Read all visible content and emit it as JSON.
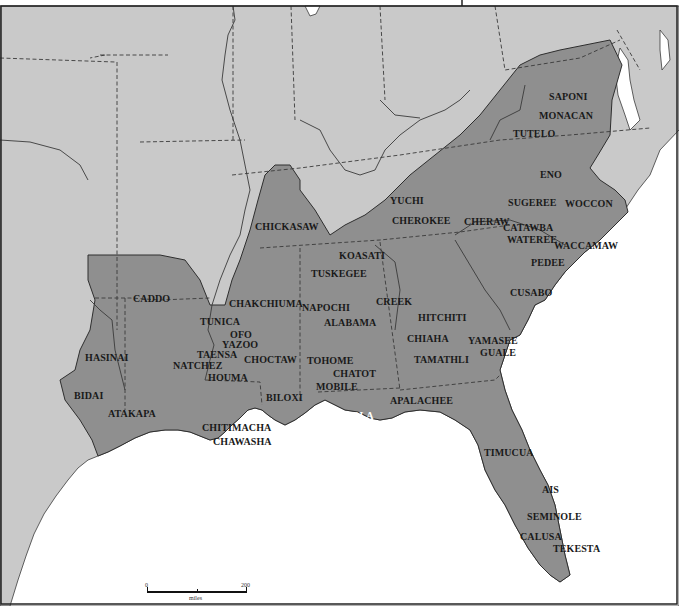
{
  "map": {
    "title": "",
    "colors": {
      "land": "#c9c9c9",
      "culture_region": "#8f8f8f",
      "water": "#ffffff",
      "boundary": "#3a3a3a"
    },
    "scale": {
      "start": "0",
      "end": "200",
      "unit": "miles"
    },
    "labels": [
      {
        "id": "saponi",
        "text": "SAPONI",
        "x": 549,
        "y": 101
      },
      {
        "id": "monacan",
        "text": "MONACAN",
        "x": 539,
        "y": 120
      },
      {
        "id": "tutelo",
        "text": "TUTELO",
        "x": 513,
        "y": 138
      },
      {
        "id": "eno",
        "text": "ENO",
        "x": 540,
        "y": 179
      },
      {
        "id": "sugeree",
        "text": "SUGEREE",
        "x": 508,
        "y": 207
      },
      {
        "id": "woccon",
        "text": "WOCCON",
        "x": 565,
        "y": 208
      },
      {
        "id": "yuchi",
        "text": "YUCHI",
        "x": 390,
        "y": 205
      },
      {
        "id": "cherokee",
        "text": "CHEROKEE",
        "x": 392,
        "y": 225
      },
      {
        "id": "cheraw",
        "text": "CHERAW",
        "x": 464,
        "y": 226
      },
      {
        "id": "catawba",
        "text": "CATAWBA",
        "x": 503,
        "y": 232
      },
      {
        "id": "wateree",
        "text": "WATEREE",
        "x": 507,
        "y": 244
      },
      {
        "id": "waccamaw",
        "text": "WACCAMAW",
        "x": 554,
        "y": 250
      },
      {
        "id": "chickasaw",
        "text": "CHICKASAW",
        "x": 255,
        "y": 231
      },
      {
        "id": "koasati",
        "text": "KOASATI",
        "x": 339,
        "y": 260
      },
      {
        "id": "tuskegee",
        "text": "TUSKEGEE",
        "x": 311,
        "y": 278
      },
      {
        "id": "pedee",
        "text": "PEDEE",
        "x": 531,
        "y": 267
      },
      {
        "id": "cusabo",
        "text": "CUSABO",
        "x": 510,
        "y": 297
      },
      {
        "id": "caddo",
        "text": "CADDO",
        "x": 133,
        "y": 303
      },
      {
        "id": "chakchiuma",
        "text": "CHAKCHIUMA",
        "x": 229,
        "y": 308
      },
      {
        "id": "napochi",
        "text": "NAPOCHI",
        "x": 302,
        "y": 312
      },
      {
        "id": "creek",
        "text": "CREEK",
        "x": 376,
        "y": 306
      },
      {
        "id": "hitchiti",
        "text": "HITCHITI",
        "x": 418,
        "y": 322
      },
      {
        "id": "tunica",
        "text": "TUNICA",
        "x": 200,
        "y": 326
      },
      {
        "id": "ofo",
        "text": "OFO",
        "x": 230,
        "y": 339
      },
      {
        "id": "alabama",
        "text": "ALABAMA",
        "x": 324,
        "y": 327
      },
      {
        "id": "yazoo",
        "text": "YAZOO",
        "x": 222,
        "y": 349
      },
      {
        "id": "chiaha",
        "text": "CHIAHA",
        "x": 407,
        "y": 343
      },
      {
        "id": "yamasee",
        "text": "YAMASEE",
        "x": 468,
        "y": 345
      },
      {
        "id": "hasinai",
        "text": "HASINAI",
        "x": 85,
        "y": 362
      },
      {
        "id": "taensa",
        "text": "TAENSA",
        "x": 197,
        "y": 359
      },
      {
        "id": "choctaw",
        "text": "CHOCTAW",
        "x": 244,
        "y": 364
      },
      {
        "id": "guale",
        "text": "GUALE",
        "x": 480,
        "y": 357
      },
      {
        "id": "tamathli",
        "text": "TAMATHLI",
        "x": 414,
        "y": 364
      },
      {
        "id": "tohome",
        "text": "TOHOME",
        "x": 307,
        "y": 365
      },
      {
        "id": "natchez",
        "text": "NATCHEZ",
        "x": 173,
        "y": 370
      },
      {
        "id": "chatot",
        "text": "CHATOT",
        "x": 333,
        "y": 378
      },
      {
        "id": "houma",
        "text": "HOUMA",
        "x": 208,
        "y": 382
      },
      {
        "id": "mobile",
        "text": "MOBILE",
        "x": 316,
        "y": 391
      },
      {
        "id": "bidai",
        "text": "BIDAI",
        "x": 74,
        "y": 400
      },
      {
        "id": "biloxi",
        "text": "BILOXI",
        "x": 266,
        "y": 402
      },
      {
        "id": "apalachee",
        "text": "APALACHEE",
        "x": 390,
        "y": 405
      },
      {
        "id": "atakapa",
        "text": "ATAKAPA",
        "x": 108,
        "y": 418
      },
      {
        "id": "pensacola",
        "text": "PENSACOLA",
        "x": 311,
        "y": 420,
        "white": true
      },
      {
        "id": "chitimacha",
        "text": "CHITIMACHA",
        "x": 202,
        "y": 432
      },
      {
        "id": "chawasha",
        "text": "CHAWASHA",
        "x": 213,
        "y": 446
      },
      {
        "id": "timucua",
        "text": "TIMUCUA",
        "x": 484,
        "y": 457
      },
      {
        "id": "ais",
        "text": "AIS",
        "x": 542,
        "y": 494
      },
      {
        "id": "seminole",
        "text": "SEMINOLE",
        "x": 527,
        "y": 521
      },
      {
        "id": "calusa",
        "text": "CALUSA",
        "x": 520,
        "y": 541
      },
      {
        "id": "tekesta",
        "text": "TEKESTA",
        "x": 553,
        "y": 553
      }
    ]
  }
}
